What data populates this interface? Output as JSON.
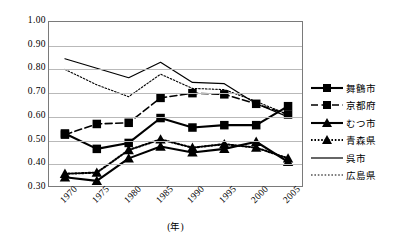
{
  "chart_data": {
    "type": "line",
    "title": "",
    "xlabel": "(年)",
    "ylabel": "",
    "categories": [
      "1970",
      "1975",
      "1980",
      "1985",
      "1990",
      "1995",
      "2000",
      "2005"
    ],
    "ylim": [
      0.3,
      1.0
    ],
    "ytick_step": 0.1,
    "yticks": [
      "1.00",
      "0.90",
      "0.80",
      "0.70",
      "0.60",
      "0.50",
      "0.40",
      "0.30"
    ],
    "grid": true,
    "legend_position": "right",
    "series": [
      {
        "name": "舞鶴市",
        "marker": "filled-square",
        "line": "solid",
        "color": "#000000",
        "values": [
          0.53,
          0.465,
          0.49,
          0.595,
          0.555,
          0.565,
          0.565,
          0.645
        ]
      },
      {
        "name": "京都府",
        "marker": "filled-square",
        "line": "dashed",
        "color": "#000000",
        "values": [
          0.525,
          0.57,
          0.575,
          0.68,
          0.7,
          0.695,
          0.655,
          0.61
        ]
      },
      {
        "name": "むつ市",
        "marker": "filled-triangle",
        "line": "solid",
        "color": "#000000",
        "values": [
          0.345,
          0.33,
          0.425,
          0.475,
          0.45,
          0.465,
          0.495,
          0.41
        ]
      },
      {
        "name": "青森県",
        "marker": "filled-triangle",
        "line": "dotted",
        "color": "#000000",
        "values": [
          0.36,
          0.365,
          0.46,
          0.505,
          0.47,
          0.485,
          0.47,
          0.425
        ]
      },
      {
        "name": "呉市",
        "marker": "none",
        "line": "solid",
        "color": "#000000",
        "values": [
          0.845,
          0.805,
          0.765,
          0.83,
          0.745,
          0.74,
          0.655,
          0.6
        ]
      },
      {
        "name": "広島県",
        "marker": "none",
        "line": "dotted",
        "color": "#000000",
        "values": [
          0.8,
          0.735,
          0.685,
          0.78,
          0.72,
          0.715,
          0.665,
          0.61
        ]
      }
    ]
  },
  "axes": {
    "x_title": "(年)"
  }
}
